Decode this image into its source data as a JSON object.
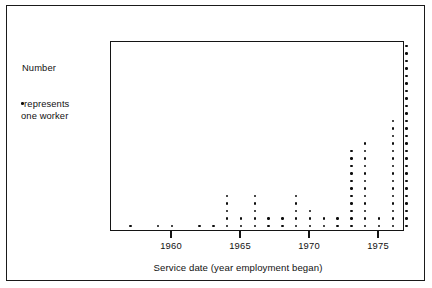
{
  "figure": {
    "background_color": "#ffffff",
    "ink_color": "#111111"
  },
  "annotations": {
    "y_axis_note": "Number",
    "legend_symbol": "dot",
    "legend_line1": "represents",
    "legend_line2": "one worker"
  },
  "axis": {
    "title": "Service date (year employment began)",
    "tick_labels": [
      "1960",
      "1965",
      "1970",
      "1975"
    ],
    "tick_values": [
      1960,
      1965,
      1970,
      1975
    ],
    "xmin": 1956.5,
    "xmax": 1977.8
  },
  "chart_data": {
    "type": "scatter",
    "plot_style": "dot-plot",
    "title": "",
    "subtitle": "",
    "xlabel": "Service date (year employment began)",
    "ylabel": "Number",
    "legend": "one dot represents one worker",
    "legend_position": "left-outside",
    "grid": false,
    "xlim": [
      1956.5,
      1977.8
    ],
    "ylim": [
      0,
      26
    ],
    "xtick_labels": [
      "1960",
      "1965",
      "1970",
      "1975"
    ],
    "xticks": [
      1960,
      1965,
      1970,
      1975
    ],
    "dot_unit": 1,
    "categories": [
      1957,
      1959,
      1960,
      1962,
      1963,
      1964,
      1965,
      1966,
      1967,
      1968,
      1969,
      1970,
      1971,
      1972,
      1973,
      1974,
      1975,
      1976,
      1977
    ],
    "values": [
      1,
      1,
      1,
      1,
      1,
      5,
      2,
      5,
      2,
      2,
      5,
      3,
      2,
      2,
      11,
      12,
      2,
      15,
      25
    ],
    "series": [
      {
        "name": "workers",
        "categories": [
          1957,
          1959,
          1960,
          1962,
          1963,
          1964,
          1965,
          1966,
          1967,
          1968,
          1969,
          1970,
          1971,
          1972,
          1973,
          1974,
          1975,
          1976,
          1977
        ],
        "values": [
          1,
          1,
          1,
          1,
          1,
          5,
          2,
          5,
          2,
          2,
          5,
          3,
          2,
          2,
          11,
          12,
          2,
          15,
          25
        ]
      }
    ],
    "total_workers": 93
  }
}
